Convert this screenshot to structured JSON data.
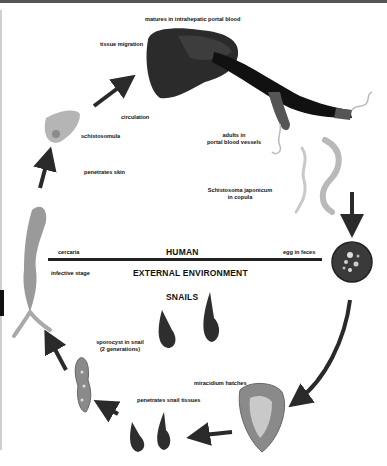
{
  "diagram": {
    "zones": {
      "upper": "HUMAN",
      "lower": "EXTERNAL ENVIRONMENT",
      "snails": "SNAILS"
    },
    "stage_labels": {
      "matures": "matures in intrahepatic portal blood",
      "tissue_migration": "tissue migration",
      "circulation": "circulation",
      "schistosomula": "schistosomula",
      "penetrates_skin": "penetrates skin",
      "adults_line1": "adults in",
      "adults_line2": "portal blood vessels",
      "species_line1": "Schistosoma japonicum",
      "species_line2": "in copula",
      "cercaria": "cercaria",
      "infective_stage": "infective stage",
      "egg_in_feces": "egg in feces",
      "sporocyst_line1": "sporocyst in snail",
      "sporocyst_line2": "(2 generations)",
      "miracidium_hatches": "miracidium hatches",
      "penetrates_snail": "penetrates snail tissues"
    },
    "colors": {
      "liver": "#2b2b2b",
      "vessel": "#111111",
      "worm": "#b9b9b9",
      "egg": "#3a3a3a",
      "snail": "#2e2e2e",
      "arrow": "#2a2a2a",
      "cercaria": "#9a9a9a"
    }
  }
}
